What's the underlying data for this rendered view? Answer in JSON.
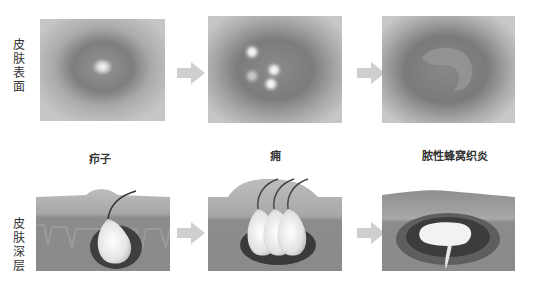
{
  "row_labels": {
    "top": "皮肤表面",
    "bottom": "皮肤深层"
  },
  "captions": [
    "疖子",
    "痈",
    "脓性蜂窝织炎"
  ],
  "stages": [
    {
      "name": "疖子",
      "surface": "single pustule spot",
      "deep": "single follicle abscess with hair"
    },
    {
      "name": "痈",
      "surface": "multiple pustule spots",
      "deep": "multiple joined follicle abscesses with hairs"
    },
    {
      "name": "脓性蜂窝织炎",
      "surface": "diffuse inflamed area",
      "deep": "spreading pus pocket in deep tissue"
    }
  ],
  "arrows": [
    "arrow-right",
    "arrow-right",
    "arrow-right",
    "arrow-right"
  ],
  "colors": {
    "skin_light": "#c9c9c9",
    "skin_mid": "#a6a6a6",
    "skin_dark": "#7a7a7a",
    "pus": "#f2f2f2",
    "arrow": "#cfcfcf"
  }
}
